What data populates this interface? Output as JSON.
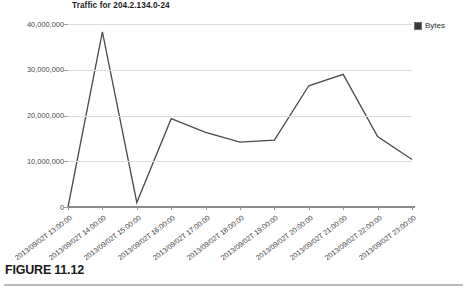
{
  "figure": {
    "caption": "FIGURE 11.12"
  },
  "legend": {
    "swatch_icon": "legend-swatch-square",
    "label": "Bytes",
    "color": "#3a3a3a",
    "position": "top-right"
  },
  "chart_data": {
    "type": "line",
    "title": "Traffic for 204.2.134.0-24",
    "xlabel": "",
    "ylabel": "",
    "categories": [
      "2013/09/02T 13:00:00",
      "2013/09/02T 14:00:00",
      "2013/09/02T 15:00:00",
      "2013/09/02T 16:00:00",
      "2013/09/02T 17:00:00",
      "2013/09/02T 18:00:00",
      "2013/09/02T 19:00:00",
      "2013/09/02T 20:00:00",
      "2013/09/02T 21:00:00",
      "2013/09/02T 22:00:00",
      "2013/09/02T 23:00:00"
    ],
    "series": [
      {
        "name": "Bytes",
        "color": "#4a4a4a",
        "values": [
          0,
          38300000,
          1000000,
          19300000,
          16300000,
          14200000,
          14600000,
          26500000,
          29000000,
          15400000,
          10400000
        ]
      }
    ],
    "ylim": [
      0,
      40000000
    ],
    "yticks": [
      0,
      10000000,
      20000000,
      30000000,
      40000000
    ],
    "ytick_labels": [
      "0",
      "10,000,000",
      "20,000,000",
      "30,000,000",
      "40,000,000"
    ],
    "grid": true,
    "grid_axis": "y",
    "legend": "Bytes",
    "legend_position": "top-right"
  }
}
